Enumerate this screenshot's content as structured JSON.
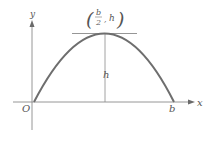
{
  "diagram": {
    "axes": {
      "x_label": "x",
      "y_label": "y",
      "origin_label": "O"
    },
    "curve": {
      "type": "parabola",
      "roots": [
        "O",
        "b"
      ],
      "root_label": "b",
      "color": "#6e6e6e"
    },
    "vertex": {
      "label_numerator": "b",
      "label_denominator": "2",
      "label_comma": ",",
      "label_y": "h",
      "label_open": "(",
      "label_close": ")"
    },
    "height_label": "h",
    "colors": {
      "axis": "#8a8a8a",
      "curve": "#6e6e6e",
      "text": "#555555"
    }
  }
}
